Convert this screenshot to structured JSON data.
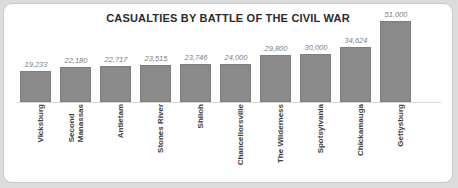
{
  "chart_data": {
    "type": "bar",
    "title": "CASUALTIES BY BATTLE OF THE CIVIL WAR",
    "xlabel": "",
    "ylabel": "",
    "ylim": [
      0,
      51000
    ],
    "grid": false,
    "legend": false,
    "categories": [
      "Vicksburg",
      "Second Manassas",
      "Antietam",
      "Stones River",
      "Shiloh",
      "Chancellorsville",
      "The Wilderness",
      "Spotsylvania",
      "Chickamauga",
      "Gettysburg"
    ],
    "values": [
      19233,
      22180,
      22717,
      23515,
      23746,
      24000,
      29800,
      30000,
      34624,
      51000
    ],
    "value_labels": [
      "19,233",
      "22,180",
      "22,717",
      "23,515",
      "23,746",
      "24,000",
      "29,800",
      "30,000",
      "34,624",
      "51,000"
    ],
    "category_lines": [
      [
        "Vicksburg"
      ],
      [
        "Second",
        "Manassas"
      ],
      [
        "Antietam"
      ],
      [
        "Stones River"
      ],
      [
        "Shiloh"
      ],
      [
        "Chancellorsville"
      ],
      [
        "The Wilderness"
      ],
      [
        "Spotsylvania"
      ],
      [
        "Chickamauga"
      ],
      [
        "Gettysburg"
      ]
    ],
    "bar_color": "#8a8a8a",
    "label_color": "#7d7d7d",
    "title_color": "#2b2b2b"
  }
}
